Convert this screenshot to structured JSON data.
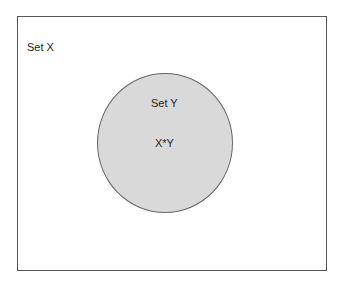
{
  "diagram": {
    "type": "venn",
    "universe": {
      "label": "Set X"
    },
    "subset": {
      "label": "Set Y",
      "fill": "#d9d9d9"
    },
    "intersection_label": "X*Y",
    "colors": {
      "border": "#555555",
      "circle_fill": "#d9d9d9",
      "background": "#ffffff"
    }
  }
}
